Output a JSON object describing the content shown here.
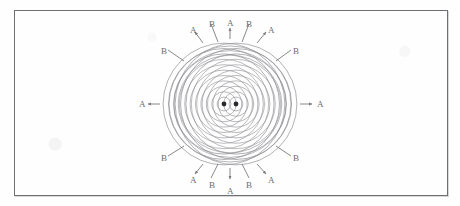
{
  "figure": {
    "background_color": "#fefefe",
    "frame": {
      "border_color": "#6e6e73",
      "x": 14,
      "y": 10,
      "width": 434,
      "height": 186
    },
    "wave_color": "#8d8d92",
    "label_color": "#6b6b70",
    "source_color": "#2b2b2e"
  },
  "sources": [
    {
      "id": "source-left",
      "cx": 224.0,
      "cy": 104.0,
      "r": 2.4
    },
    {
      "id": "source-right",
      "cx": 236.0,
      "cy": 104.0,
      "r": 2.4
    }
  ],
  "pattern": {
    "center_x": 230,
    "center_y": 104,
    "outer_radius_x": 61,
    "outer_radius_y": 58,
    "ring_count": 11,
    "ring_spacing": 5.4
  },
  "labels": [
    {
      "id": "label-a-top-left-outer",
      "text": "A",
      "x": 190,
      "y": 26
    },
    {
      "id": "label-b-top-left-inner",
      "text": "B",
      "x": 209,
      "y": 20
    },
    {
      "id": "label-a-top-center",
      "text": "A",
      "x": 227,
      "y": 19
    },
    {
      "id": "label-b-top-right-inner",
      "text": "B",
      "x": 246,
      "y": 20
    },
    {
      "id": "label-a-top-right-outer",
      "text": "A",
      "x": 268,
      "y": 26
    },
    {
      "id": "label-b-upper-left",
      "text": "B",
      "x": 161,
      "y": 47
    },
    {
      "id": "label-b-upper-right",
      "text": "B",
      "x": 293,
      "y": 47
    },
    {
      "id": "label-a-left",
      "text": "A",
      "x": 139,
      "y": 100
    },
    {
      "id": "label-a-right",
      "text": "A",
      "x": 317,
      "y": 100
    },
    {
      "id": "label-b-lower-left",
      "text": "B",
      "x": 161,
      "y": 154
    },
    {
      "id": "label-b-lower-right",
      "text": "B",
      "x": 293,
      "y": 154
    },
    {
      "id": "label-a-bottom-left-outer",
      "text": "A",
      "x": 190,
      "y": 176
    },
    {
      "id": "label-b-bottom-left-inner",
      "text": "B",
      "x": 209,
      "y": 181
    },
    {
      "id": "label-a-bottom-center",
      "text": "A",
      "x": 227,
      "y": 187
    },
    {
      "id": "label-b-bottom-right-inner",
      "text": "B",
      "x": 246,
      "y": 181
    },
    {
      "id": "label-a-bottom-right-outer",
      "text": "A",
      "x": 268,
      "y": 176
    }
  ],
  "leaders": {
    "arrows": [
      {
        "id": "arrow-a-top-center",
        "x1": 230,
        "y1": 39,
        "x2": 230,
        "y2": 28
      },
      {
        "id": "arrow-a-top-left-outer",
        "x1": 203,
        "y1": 43,
        "x2": 195,
        "y2": 32
      },
      {
        "id": "arrow-a-top-right-outer",
        "x1": 257,
        "y1": 43,
        "x2": 266,
        "y2": 32
      },
      {
        "id": "arrow-a-left",
        "x1": 160,
        "y1": 104,
        "x2": 148,
        "y2": 104
      },
      {
        "id": "arrow-a-right",
        "x1": 300,
        "y1": 104,
        "x2": 312,
        "y2": 104
      },
      {
        "id": "arrow-a-bottom-center",
        "x1": 230,
        "y1": 168,
        "x2": 230,
        "y2": 179
      },
      {
        "id": "arrow-a-bottom-left-outer",
        "x1": 203,
        "y1": 164,
        "x2": 195,
        "y2": 174
      },
      {
        "id": "arrow-a-bottom-right-outer",
        "x1": 257,
        "y1": 164,
        "x2": 266,
        "y2": 174
      }
    ],
    "lines": [
      {
        "id": "leader-b-top-left-inner",
        "x1": 211,
        "y1": 24,
        "x2": 218,
        "y2": 42
      },
      {
        "id": "leader-b-top-right-inner",
        "x1": 249,
        "y1": 24,
        "x2": 242,
        "y2": 42
      },
      {
        "id": "leader-b-upper-left",
        "x1": 168,
        "y1": 50,
        "x2": 184,
        "y2": 61
      },
      {
        "id": "leader-b-upper-right",
        "x1": 291,
        "y1": 50,
        "x2": 276,
        "y2": 61
      },
      {
        "id": "leader-b-lower-left",
        "x1": 168,
        "y1": 156,
        "x2": 184,
        "y2": 146
      },
      {
        "id": "leader-b-lower-right",
        "x1": 291,
        "y1": 156,
        "x2": 276,
        "y2": 146
      },
      {
        "id": "leader-b-bottom-left-inner",
        "x1": 211,
        "y1": 178,
        "x2": 218,
        "y2": 164
      },
      {
        "id": "leader-b-bottom-right-inner",
        "x1": 249,
        "y1": 178,
        "x2": 242,
        "y2": 164
      }
    ]
  },
  "legend_keys": {
    "antinodal_key": "A",
    "nodal_key": "B"
  }
}
